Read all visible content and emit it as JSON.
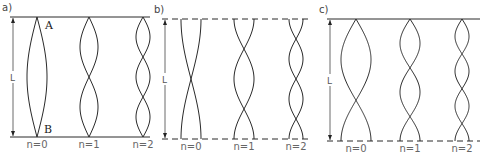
{
  "figure": {
    "stroke_color": "#2a2a2a",
    "panels": [
      {
        "id": "a",
        "label": "a)",
        "boundary": "solid",
        "top_y": 17,
        "bottom_y": 137,
        "x1": 10,
        "x2": 150,
        "dim_x": 13,
        "length_label": "L",
        "points": {
          "top": "A",
          "bottom": "B"
        },
        "modes": [
          {
            "label": "n=0",
            "type": "pinned-pinned",
            "cx": 37,
            "half_width": 10,
            "loops": 1
          },
          {
            "label": "n=1",
            "type": "pinned-pinned",
            "cx": 89,
            "half_width": 9,
            "loops": 2
          },
          {
            "label": "n=2",
            "type": "pinned-pinned",
            "cx": 143,
            "half_width": 7,
            "loops": 3
          }
        ]
      },
      {
        "id": "b",
        "label": "b)",
        "boundary": "dashed",
        "top_y": 19,
        "bottom_y": 139,
        "x1": 162,
        "x2": 312,
        "dim_x": 165,
        "length_label": "L",
        "modes": [
          {
            "label": "n=0",
            "type": "clamped-clamped",
            "cx": 191,
            "half_width": 10,
            "loops": 1
          },
          {
            "label": "n=1",
            "type": "clamped-clamped",
            "cx": 244,
            "half_width": 10,
            "loops": 2
          },
          {
            "label": "n=2",
            "type": "clamped-clamped",
            "cx": 296,
            "half_width": 7,
            "loops": 3
          }
        ]
      },
      {
        "id": "c",
        "label": "c)",
        "boundary": "top-solid-bottom-dashed",
        "top_y": 19,
        "bottom_y": 141,
        "x1": 327,
        "x2": 480,
        "dim_x": 330,
        "length_label": "L",
        "modes": [
          {
            "label": "n=0",
            "type": "pinned-clamped",
            "cx": 356,
            "half_width": 15,
            "loops": 1
          },
          {
            "label": "n=1",
            "type": "pinned-clamped",
            "cx": 410,
            "half_width": 10,
            "loops": 2
          },
          {
            "label": "n=2",
            "type": "pinned-clamped",
            "cx": 462,
            "half_width": 7,
            "loops": 3
          }
        ]
      }
    ]
  }
}
